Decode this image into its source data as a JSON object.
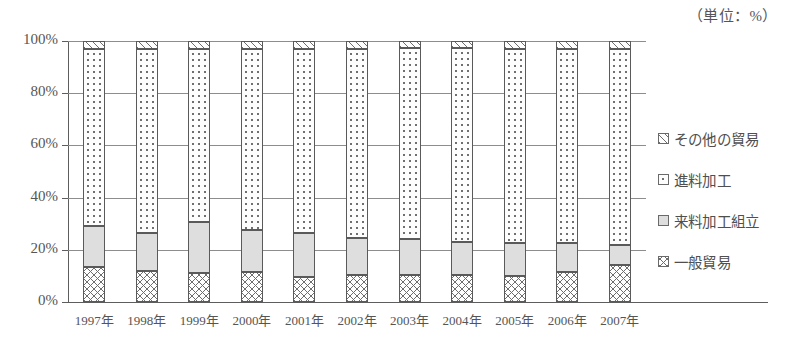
{
  "chart_data": {
    "type": "bar",
    "subtype": "stacked-percentage",
    "title": "",
    "unit_note": "（単位：%）",
    "xlabel": "",
    "ylabel": "",
    "ylim": [
      0,
      100
    ],
    "ytick_labels": [
      "0%",
      "20%",
      "40%",
      "60%",
      "80%",
      "100%"
    ],
    "ytick_values": [
      0,
      20,
      40,
      60,
      80,
      100
    ],
    "grid": true,
    "grid_axis": "y",
    "legend_position": "right",
    "categories": [
      "1997年",
      "1998年",
      "1999年",
      "2000年",
      "2001年",
      "2002年",
      "2003年",
      "2004年",
      "2005年",
      "2006年",
      "2007年"
    ],
    "series": [
      {
        "name": "一般貿易",
        "pattern": "crosshatch",
        "values": [
          13.5,
          12.0,
          11.0,
          11.5,
          9.5,
          10.5,
          10.5,
          10.5,
          10.0,
          11.5,
          14.0
        ]
      },
      {
        "name": "来料加工組立",
        "pattern": "light-gray",
        "values": [
          15.5,
          14.5,
          19.5,
          16.0,
          17.0,
          14.0,
          13.5,
          12.5,
          12.5,
          11.0,
          8.0
        ]
      },
      {
        "name": "進料加工",
        "pattern": "fine-dots",
        "values": [
          68.0,
          70.5,
          66.5,
          69.5,
          70.5,
          72.5,
          73.5,
          74.5,
          74.5,
          74.5,
          75.0
        ]
      },
      {
        "name": "その他の貿易",
        "pattern": "diagonal-hatch",
        "values": [
          3.0,
          3.0,
          3.0,
          3.0,
          3.0,
          3.0,
          2.5,
          2.5,
          3.0,
          3.0,
          3.0
        ]
      }
    ]
  },
  "legend": {
    "items": [
      {
        "label": "その他の貿易",
        "pattern": "diagonal-hatch"
      },
      {
        "label": "進料加工",
        "pattern": "fine-dots"
      },
      {
        "label": "来料加工組立",
        "pattern": "light-gray"
      },
      {
        "label": "一般貿易",
        "pattern": "crosshatch"
      }
    ]
  }
}
